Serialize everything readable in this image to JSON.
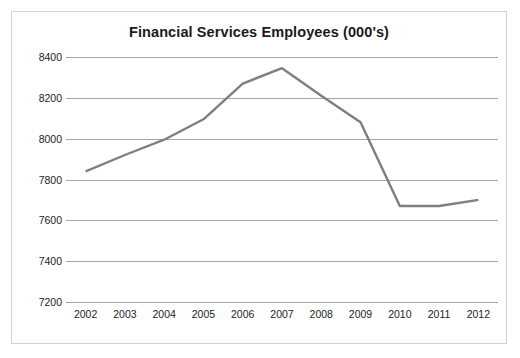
{
  "chart_data": {
    "type": "line",
    "title": "Financial Services Employees (000's)",
    "xlabel": "",
    "ylabel": "",
    "categories": [
      "2002",
      "2003",
      "2004",
      "2005",
      "2006",
      "2007",
      "2008",
      "2009",
      "2010",
      "2011",
      "2012"
    ],
    "series": [
      {
        "name": "Financial Services Employees",
        "values": [
          7840,
          7920,
          7995,
          8095,
          8270,
          8345,
          8210,
          8080,
          7670,
          7670,
          7700
        ]
      }
    ],
    "ylim": [
      7200,
      8400
    ],
    "yticks": [
      7200,
      7400,
      7600,
      7800,
      8000,
      8200,
      8400
    ],
    "ytick_labels": [
      "7200",
      "7400",
      "7600",
      "7800",
      "8000",
      "8200",
      "8400"
    ],
    "grid": "horizontal",
    "legend": "none",
    "colors": {
      "series_line": "#7f7f7f",
      "gridline": "#a6a6a6",
      "border": "#d2d2d2",
      "text": "#222222",
      "background": "#ffffff"
    }
  }
}
